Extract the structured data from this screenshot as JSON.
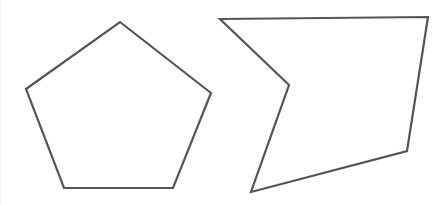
{
  "diagram": {
    "stroke_color": "#555555",
    "fill_color": "#ffffff",
    "stroke_width": 2.2,
    "shapes": [
      {
        "name": "regular-pentagon",
        "type": "convex-polygon",
        "sides": 5,
        "points": "120,22 211,93 173,188 64,188 26,89"
      },
      {
        "name": "concave-pentagon",
        "type": "concave-polygon",
        "sides": 5,
        "points": "220,19 428,17 407,151 251,192 289,85"
      }
    ]
  }
}
